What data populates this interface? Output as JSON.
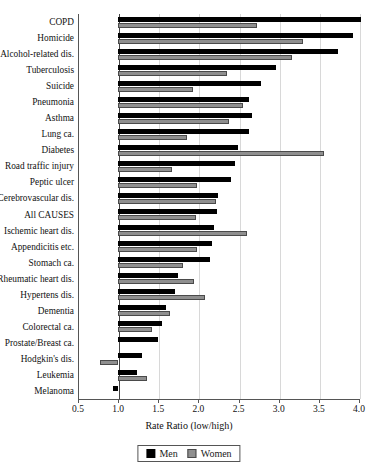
{
  "chart_data": {
    "type": "bar",
    "orientation": "horizontal",
    "title": "",
    "xlabel": "Rate Ratio (low/high)",
    "ylabel": "",
    "xlim": [
      0.5,
      4.0
    ],
    "xticks": [
      "0.5",
      "1.0",
      "1.5",
      "2.0",
      "2.5",
      "3.0",
      "3.5",
      "4.0"
    ],
    "xtick_values": [
      0.5,
      1.0,
      1.5,
      2.0,
      2.5,
      3.0,
      3.5,
      4.0
    ],
    "grid": true,
    "reference_line": 1.0,
    "legend_position": "bottom-center",
    "legend": [
      "Men",
      "Women"
    ],
    "categories": [
      "COPD",
      "Homicide",
      "Alcohol-related dis.",
      "Tuberculosis",
      "Suicide",
      "Pneumonia",
      "Asthma",
      "Lung ca.",
      "Diabetes",
      "Road traffic injury",
      "Peptic ulcer",
      "Cerebrovascular dis.",
      "All CAUSES",
      "Ischemic heart dis.",
      "Appendicitis etc.",
      "Stomach ca.",
      "Rheumatic heart dis.",
      "Hypertens dis.",
      "Dementia",
      "Colorectal ca.",
      "Prostate/Breast ca.",
      "Hodgkin's dis.",
      "Leukemia",
      "Melanoma"
    ],
    "series": [
      {
        "name": "Men",
        "color": "#000000",
        "values": [
          4.02,
          3.92,
          3.74,
          2.97,
          2.78,
          2.63,
          2.67,
          2.63,
          2.49,
          2.46,
          2.41,
          2.25,
          2.23,
          2.19,
          2.17,
          2.15,
          1.75,
          1.71,
          1.6,
          1.55,
          1.5,
          1.3,
          1.24,
          0.93
        ]
      },
      {
        "name": "Women",
        "color": "#8f8f8f",
        "values": [
          2.73,
          3.3,
          3.17,
          2.35,
          1.93,
          2.55,
          2.38,
          1.86,
          3.56,
          1.67,
          1.98,
          2.22,
          1.97,
          2.6,
          1.98,
          1.81,
          1.95,
          2.08,
          1.65,
          1.42,
          null,
          0.78,
          1.36,
          null
        ]
      }
    ]
  }
}
